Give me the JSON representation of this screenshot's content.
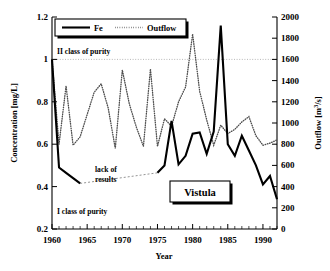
{
  "chart_data": {
    "type": "line",
    "title": "",
    "annotations": [
      {
        "name": "river-label",
        "text": "Vistula"
      },
      {
        "name": "class-two-label",
        "text": "II class of purity"
      },
      {
        "name": "class-one-label",
        "text": "I class of purity"
      },
      {
        "name": "lack-of-results-line1",
        "text": "lack of"
      },
      {
        "name": "lack-of-results-line2",
        "text": "results"
      }
    ],
    "xlabel": "Year",
    "xlim": [
      1960,
      1992
    ],
    "xticks": [
      1960,
      1965,
      1970,
      1975,
      1980,
      1985,
      1990
    ],
    "xtick_labels": [
      "1960",
      "1965",
      "1970",
      "1975",
      "1980",
      "1985",
      "1990"
    ],
    "x_minor_step": 1,
    "grid": true,
    "gridlines_y": [
      1.0
    ],
    "legend_position": "top-left",
    "legend": [
      "Fe",
      "Outflow"
    ],
    "axes": [
      {
        "name": "left",
        "ylabel": "Concentration [mg/L]",
        "ylim": [
          0.2,
          1.2
        ],
        "yticks": [
          0.2,
          0.4,
          0.6,
          0.8,
          1.0,
          1.2
        ],
        "ytick_labels": [
          "0.2",
          "0.4",
          "0.6",
          "0.8",
          "1",
          "1.2"
        ]
      },
      {
        "name": "right",
        "ylabel": "Outflow [m3/s]",
        "ylabel_display": "Outflow [m",
        "ylabel_sup": "3",
        "ylabel_tail": "/s]",
        "ylim": [
          0,
          2000
        ],
        "yticks": [
          0,
          200,
          400,
          600,
          800,
          1000,
          1200,
          1400,
          1600,
          1800,
          2000
        ],
        "ytick_labels": [
          "0",
          "200",
          "400",
          "600",
          "800",
          "1000",
          "1200",
          "1400",
          "1600",
          "1800",
          "2000"
        ]
      }
    ],
    "series": [
      {
        "name": "Fe",
        "axis": "left",
        "style": "solid",
        "color": "#000000",
        "unit": "mg/L",
        "x": [
          1960,
          1961,
          1962,
          1963,
          1964,
          1975,
          1976,
          1977,
          1978,
          1979,
          1980,
          1981,
          1982,
          1983,
          1984,
          1985,
          1986,
          1987,
          1988,
          1989,
          1990,
          1991,
          1992
        ],
        "values": [
          1.0,
          0.49,
          0.465,
          0.44,
          0.415,
          0.465,
          0.5,
          0.71,
          0.505,
          0.545,
          0.65,
          0.655,
          0.555,
          0.66,
          1.16,
          0.6,
          0.545,
          0.64,
          0.57,
          0.5,
          0.41,
          0.45,
          0.34
        ]
      },
      {
        "name": "Outflow",
        "axis": "right",
        "style": "dotted",
        "color": "#4d4d4d",
        "unit": "m3/s",
        "x": [
          1960,
          1961,
          1962,
          1963,
          1964,
          1965,
          1966,
          1967,
          1968,
          1969,
          1970,
          1971,
          1972,
          1973,
          1974,
          1975,
          1976,
          1977,
          1978,
          1979,
          1980,
          1981,
          1982,
          1983,
          1984,
          1985,
          1986,
          1987,
          1988,
          1989,
          1990,
          1991,
          1992
        ],
        "values": [
          1600,
          800,
          1350,
          790,
          870,
          1080,
          1290,
          1370,
          1140,
          760,
          1500,
          1180,
          960,
          780,
          1510,
          780,
          1040,
          970,
          1200,
          1340,
          1840,
          1300,
          1030,
          790,
          980,
          900,
          940,
          1010,
          1060,
          880,
          790,
          810,
          840
        ]
      }
    ],
    "data_gap": {
      "series": "Fe",
      "from_year": 1964,
      "to_year": 1975,
      "note": "lack of results"
    }
  }
}
